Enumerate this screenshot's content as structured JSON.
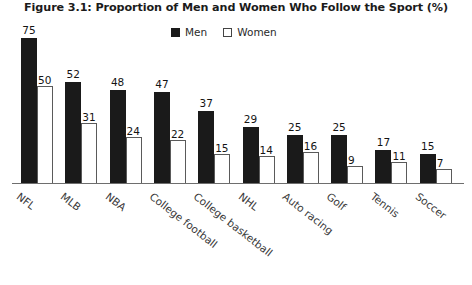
{
  "chart_data": {
    "type": "bar",
    "title": "Figure 3.1: Proportion of Men and Women Who Follow the Sport (%)",
    "xlabel": "",
    "ylabel": "",
    "ylim": [
      0,
      75
    ],
    "grid": false,
    "legend_position": "top-center",
    "categories": [
      "NFL",
      "MLB",
      "NBA",
      "College football",
      "College basketball",
      "NHL",
      "Auto racing",
      "Golf",
      "Tennis",
      "Soccer"
    ],
    "series": [
      {
        "name": "Men",
        "color": "#1a1a1a",
        "values": [
          75,
          52,
          48,
          47,
          37,
          29,
          25,
          25,
          17,
          15
        ]
      },
      {
        "name": "Women",
        "color": "#ffffff",
        "values": [
          50,
          31,
          24,
          22,
          15,
          14,
          16,
          9,
          11,
          7
        ]
      }
    ]
  },
  "legend": {
    "items": [
      {
        "label": "Men",
        "swatch": "filled-square-swatch"
      },
      {
        "label": "Women",
        "swatch": "outlined-square-swatch"
      }
    ]
  }
}
